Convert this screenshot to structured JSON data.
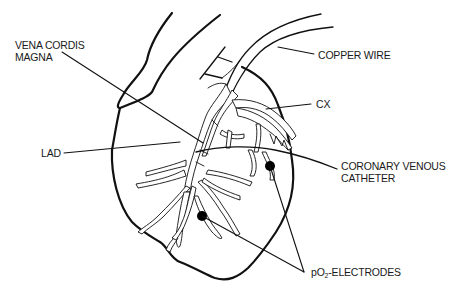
{
  "diagram": {
    "type": "anatomical-line-drawing",
    "labels": {
      "vena_cordis_magna_line1": "VENA CORDIS",
      "vena_cordis_magna_line2": "MAGNA",
      "copper_wire": "COPPER WIRE",
      "cx": "CX",
      "lad": "LAD",
      "coronary_venous_catheter_line1": "CORONARY VENOUS",
      "coronary_venous_catheter_line2": "CATHETER",
      "po2_electrodes_prefix": "pO",
      "po2_electrodes_sub": "2",
      "po2_electrodes_suffix": "-ELECTRODES"
    },
    "colors": {
      "ink": "#111111",
      "background": "#ffffff"
    },
    "electrodes": [
      {
        "name": "electrode-upper-right",
        "x": 270,
        "y": 166
      },
      {
        "name": "electrode-lower-left",
        "x": 202,
        "y": 216
      }
    ]
  }
}
